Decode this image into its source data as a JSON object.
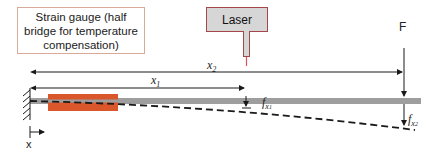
{
  "diagram": {
    "strain_gauge_label": "Strain gauge (half bridge for temperature compensation)",
    "laser_label": "Laser",
    "force_label": "F",
    "axis_label": "x",
    "dimensions": {
      "x1": {
        "base": "x",
        "sub": "1"
      },
      "x2": {
        "base": "x",
        "sub": "2"
      }
    },
    "deflections": {
      "fx1": {
        "base": "f",
        "sub_base": "x",
        "sub_sub": "1"
      },
      "fx2": {
        "base": "f",
        "sub_base": "x",
        "sub_sub": "2"
      }
    },
    "colors": {
      "beam": "#9e9e9e",
      "strain_gauge": "#d9572a",
      "laser_border": "#a5474a",
      "laser_fill": "#d6d6d6",
      "laser_beam": "#e0505a",
      "gauge_box_border": "#d9a99c",
      "lines": "#1a1a1a"
    }
  }
}
